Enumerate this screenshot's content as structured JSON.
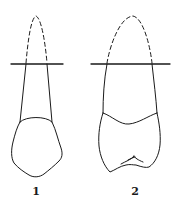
{
  "figure": {
    "stroke_color": "#1a1a1a",
    "background": "#ffffff",
    "teeth": [
      {
        "id": "tooth-1",
        "label": "1",
        "view": "narrow crown with single root, dashed root tip above reference line"
      },
      {
        "id": "tooth-2",
        "label": "2",
        "view": "broad crown with cusps and fissure, dashed root tip above reference line"
      }
    ]
  }
}
